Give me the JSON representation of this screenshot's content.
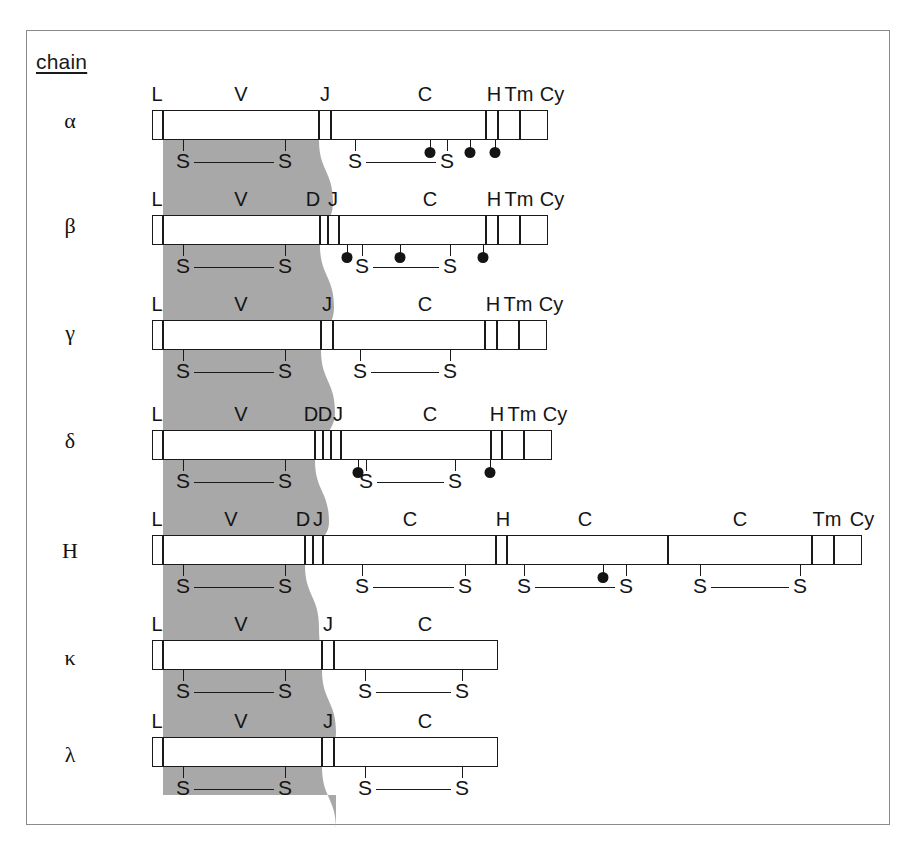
{
  "diagram": {
    "title_label": "chain",
    "shade_color": "#a8a8a8",
    "line_color": "#1a1a1a",
    "background": "#ffffff",
    "frame_color": "#8a8a8a"
  },
  "legend": {
    "segment_names": {
      "L": "L",
      "V": "V",
      "D": "D",
      "J": "J",
      "C": "C",
      "H": "H",
      "Tm": "Tm",
      "Cy": "Cy"
    },
    "disulfide_label": "S",
    "glycosylation_marker": "filled-circle"
  },
  "rows": [
    {
      "name": "alpha",
      "label": "α",
      "label_y": 108,
      "bar_y": 110,
      "segments": [
        {
          "label": "L",
          "x": 152,
          "w": 11,
          "label_x": 157
        },
        {
          "label": "V",
          "x": 163,
          "w": 156,
          "label_x": 241
        },
        {
          "label": "J",
          "x": 319,
          "w": 12,
          "label_x": 325
        },
        {
          "label": "C",
          "x": 331,
          "w": 155,
          "label_x": 425
        },
        {
          "label": "H",
          "x": 486,
          "w": 12,
          "label_x": 494
        },
        {
          "label": "Tm",
          "x": 498,
          "w": 22,
          "label_x": 519
        },
        {
          "label": "Cy",
          "x": 520,
          "w": 28,
          "label_x": 552
        }
      ],
      "disulfides": [
        {
          "x1": 183,
          "x2": 285
        },
        {
          "x1": 355,
          "x2": 447
        }
      ],
      "glycosylation": [
        430,
        470,
        495
      ]
    },
    {
      "name": "beta",
      "label": "β",
      "label_y": 213,
      "bar_y": 215,
      "segments": [
        {
          "label": "L",
          "x": 152,
          "w": 11,
          "label_x": 157
        },
        {
          "label": "V",
          "x": 163,
          "w": 157,
          "label_x": 241
        },
        {
          "label": "D",
          "x": 320,
          "w": 8,
          "label_x": 313
        },
        {
          "label": "J",
          "x": 328,
          "w": 11,
          "label_x": 333
        },
        {
          "label": "C",
          "x": 339,
          "w": 147,
          "label_x": 430
        },
        {
          "label": "H",
          "x": 486,
          "w": 12,
          "label_x": 494
        },
        {
          "label": "Tm",
          "x": 498,
          "w": 22,
          "label_x": 519
        },
        {
          "label": "Cy",
          "x": 520,
          "w": 28,
          "label_x": 552
        }
      ],
      "disulfides": [
        {
          "x1": 183,
          "x2": 285
        },
        {
          "x1": 362,
          "x2": 450
        }
      ],
      "glycosylation": [
        347,
        400,
        483
      ]
    },
    {
      "name": "gamma",
      "label": "γ",
      "label_y": 320,
      "bar_y": 320,
      "segments": [
        {
          "label": "L",
          "x": 152,
          "w": 11,
          "label_x": 157
        },
        {
          "label": "V",
          "x": 163,
          "w": 158,
          "label_x": 241
        },
        {
          "label": "J",
          "x": 321,
          "w": 12,
          "label_x": 327
        },
        {
          "label": "C",
          "x": 333,
          "w": 152,
          "label_x": 425
        },
        {
          "label": "H",
          "x": 485,
          "w": 12,
          "label_x": 493
        },
        {
          "label": "Tm",
          "x": 497,
          "w": 22,
          "label_x": 518
        },
        {
          "label": "Cy",
          "x": 519,
          "w": 28,
          "label_x": 551
        }
      ],
      "disulfides": [
        {
          "x1": 183,
          "x2": 285
        },
        {
          "x1": 360,
          "x2": 450
        }
      ],
      "glycosylation": []
    },
    {
      "name": "delta",
      "label": "δ",
      "label_y": 428,
      "bar_y": 430,
      "segments": [
        {
          "label": "L",
          "x": 152,
          "w": 11,
          "label_x": 157
        },
        {
          "label": "V",
          "x": 163,
          "w": 152,
          "label_x": 241
        },
        {
          "label": "D",
          "x": 315,
          "w": 8,
          "label_x": 311
        },
        {
          "label": "D",
          "x": 323,
          "w": 8,
          "label_x": 325
        },
        {
          "label": "J",
          "x": 331,
          "w": 10,
          "label_x": 338
        },
        {
          "label": "C",
          "x": 341,
          "w": 150,
          "label_x": 430
        },
        {
          "label": "H",
          "x": 491,
          "w": 11,
          "label_x": 497
        },
        {
          "label": "Tm",
          "x": 502,
          "w": 22,
          "label_x": 522
        },
        {
          "label": "Cy",
          "x": 524,
          "w": 28,
          "label_x": 555
        }
      ],
      "disulfides": [
        {
          "x1": 183,
          "x2": 285
        },
        {
          "x1": 366,
          "x2": 455
        }
      ],
      "glycosylation": [
        358,
        490
      ]
    },
    {
      "name": "H",
      "label": "H",
      "label_y": 538,
      "bar_y": 535,
      "segments": [
        {
          "label": "L",
          "x": 152,
          "w": 11,
          "label_x": 157
        },
        {
          "label": "V",
          "x": 163,
          "w": 142,
          "label_x": 231
        },
        {
          "label": "D",
          "x": 305,
          "w": 8,
          "label_x": 303
        },
        {
          "label": "J",
          "x": 313,
          "w": 10,
          "label_x": 318
        },
        {
          "label": "C",
          "x": 323,
          "w": 173,
          "label_x": 410
        },
        {
          "label": "H",
          "x": 496,
          "w": 11,
          "label_x": 503
        },
        {
          "label": "C",
          "x": 507,
          "w": 161,
          "label_x": 585
        },
        {
          "label": "C",
          "x": 668,
          "w": 144,
          "label_x": 740
        },
        {
          "label": "Tm",
          "x": 812,
          "w": 22,
          "label_x": 827
        },
        {
          "label": "Cy",
          "x": 834,
          "w": 28,
          "label_x": 862
        }
      ],
      "disulfides": [
        {
          "x1": 183,
          "x2": 285
        },
        {
          "x1": 362,
          "x2": 465
        },
        {
          "x1": 524,
          "x2": 626
        },
        {
          "x1": 700,
          "x2": 800
        }
      ],
      "glycosylation": [
        603
      ]
    },
    {
      "name": "kappa",
      "label": "κ",
      "label_y": 645,
      "bar_y": 640,
      "segments": [
        {
          "label": "L",
          "x": 152,
          "w": 11,
          "label_x": 157
        },
        {
          "label": "V",
          "x": 163,
          "w": 159,
          "label_x": 241
        },
        {
          "label": "J",
          "x": 322,
          "w": 12,
          "label_x": 328
        },
        {
          "label": "C",
          "x": 334,
          "w": 164,
          "label_x": 425
        }
      ],
      "disulfides": [
        {
          "x1": 183,
          "x2": 285
        },
        {
          "x1": 365,
          "x2": 462
        }
      ],
      "glycosylation": []
    },
    {
      "name": "lambda",
      "label": "λ",
      "label_y": 742,
      "bar_y": 737,
      "segments": [
        {
          "label": "L",
          "x": 152,
          "w": 11,
          "label_x": 157
        },
        {
          "label": "V",
          "x": 163,
          "w": 159,
          "label_x": 241
        },
        {
          "label": "J",
          "x": 322,
          "w": 12,
          "label_x": 328
        },
        {
          "label": "C",
          "x": 334,
          "w": 164,
          "label_x": 425
        }
      ],
      "disulfides": [
        {
          "x1": 183,
          "x2": 285
        },
        {
          "x1": 365,
          "x2": 462
        }
      ],
      "glycosylation": []
    }
  ]
}
